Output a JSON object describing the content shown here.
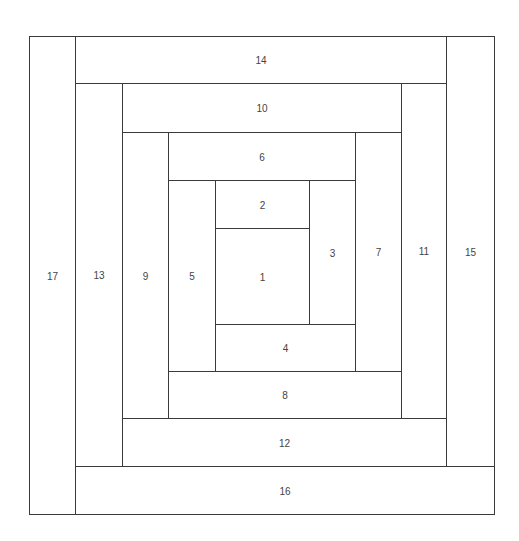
{
  "diagram": {
    "pieces": [
      {
        "label": "1"
      },
      {
        "label": "2"
      },
      {
        "label": "3"
      },
      {
        "label": "4"
      },
      {
        "label": "5"
      },
      {
        "label": "6"
      },
      {
        "label": "7"
      },
      {
        "label": "8"
      },
      {
        "label": "9"
      },
      {
        "label": "10"
      },
      {
        "label": "11"
      },
      {
        "label": "12"
      },
      {
        "label": "13"
      },
      {
        "label": "14"
      },
      {
        "label": "15"
      },
      {
        "label": "16"
      },
      {
        "label": "17"
      }
    ],
    "line_color": "#3a3a3a",
    "text_color": "#444444"
  }
}
